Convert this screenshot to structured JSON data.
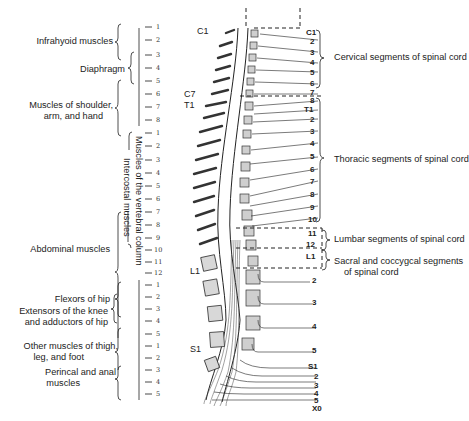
{
  "left_groups": [
    {
      "label": "Infrahyoid muscles"
    },
    {
      "label": "Diaphragm"
    },
    {
      "label_line1": "Muscles of shoulder,",
      "label_line2": "arm, and hand"
    },
    {
      "label": "Abdominal muscles"
    },
    {
      "label": "Flexors of hip"
    },
    {
      "label_line1": "Extensors of the knee",
      "label_line2": "and adductors of hip"
    },
    {
      "label_line1": "Other muscles of thigh,",
      "label_line2": "leg, and foot"
    },
    {
      "label_line1": "Perincal and anal",
      "label_line2": "muscles"
    }
  ],
  "vertical_labels": {
    "vertebral_column": "Muscles of the vertebral column",
    "intercostal": "Intercostal muscles"
  },
  "segment_ticks": {
    "cervical": [
      "1",
      "2",
      "3",
      "4",
      "5",
      "6",
      "7",
      "8"
    ],
    "thoracic": [
      "1",
      "2",
      "3",
      "4",
      "5",
      "6",
      "7",
      "8",
      "9",
      "10",
      "11",
      "12"
    ],
    "lumbar": [
      "1",
      "2",
      "3",
      "4",
      "5"
    ],
    "sacral": [
      "1",
      "2",
      "3",
      "4",
      "5"
    ]
  },
  "vertebra_labels": {
    "c1": "C1",
    "c7": "C7",
    "t1": "T1",
    "l1": "L1",
    "s1": "S1"
  },
  "right_groups": [
    {
      "label": "Cervical segments of spinal cord"
    },
    {
      "label": "Thoracic segments of spinal cord"
    },
    {
      "label": "Lumbar segments of spinal cord"
    },
    {
      "label_line1": "Sacral and coccygcal segments",
      "label_line2": "of spinal cord"
    }
  ],
  "cord_numbers": {
    "cervical": [
      "C1",
      "2",
      "3",
      "4",
      "5",
      "6",
      "7",
      "8"
    ],
    "thoracic": [
      "T1",
      "2",
      "3",
      "4",
      "5",
      "6",
      "7",
      "8",
      "9",
      "10",
      "11",
      "12"
    ],
    "lumbar": [
      "L1",
      "2",
      "3",
      "4",
      "5"
    ],
    "sacral": [
      "S1",
      "2",
      "3",
      "4",
      "5",
      "X0"
    ]
  },
  "inner_vertebra_numbers": {
    "cervical": [
      "C1",
      "2",
      "3",
      "4",
      "5",
      "6",
      "7"
    ],
    "thoracic": [
      "T1",
      "2",
      "3",
      "4",
      "5",
      "6",
      "7",
      "8",
      "9",
      "10",
      "11",
      "12"
    ],
    "lumbar": [
      "L1",
      "II",
      "III",
      "IV",
      "V"
    ],
    "sacral": [
      "S1",
      "2",
      "3",
      "4",
      "5",
      "X0"
    ]
  }
}
